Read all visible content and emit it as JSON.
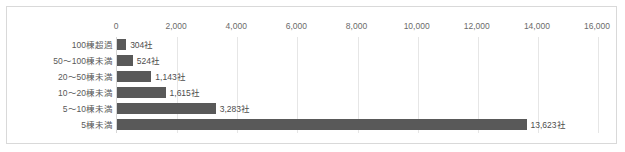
{
  "chart_data": {
    "type": "bar",
    "orientation": "horizontal",
    "title": "",
    "subtitle": "",
    "xlabel": "",
    "ylabel": "",
    "xlim": [
      0,
      16000
    ],
    "grid": true,
    "legend": "none",
    "unit_suffix": "社",
    "bar_color": "#595959",
    "gridline_color": "#e6e6e6",
    "border_color": "#d9d9d9",
    "tick_label_color": "#6b6b6b",
    "xticks": [
      0,
      2000,
      4000,
      6000,
      8000,
      10000,
      12000,
      14000,
      16000
    ],
    "xtick_labels": [
      "0",
      "2,000",
      "4,000",
      "6,000",
      "8,000",
      "10,000",
      "12,000",
      "14,000",
      "16,000"
    ],
    "categories": [
      "100棟超過",
      "50〜100棟未満",
      "20〜50棟未満",
      "10〜20棟未満",
      "5〜10棟未満",
      "5棟未満"
    ],
    "values": [
      304,
      524,
      1143,
      1615,
      3283,
      13623
    ],
    "data_labels": [
      "304社",
      "524社",
      "1,143社",
      "1,615社",
      "3,283社",
      "13,623社"
    ]
  }
}
